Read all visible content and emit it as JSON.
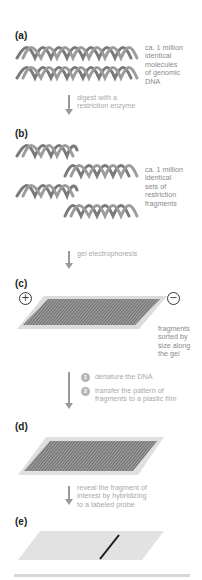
{
  "panels": {
    "a": {
      "label": "(a)",
      "description": [
        "ca. 1 million",
        "identical",
        "molecules",
        "of genomic",
        "DNA"
      ]
    },
    "b": {
      "label": "(b)",
      "description": [
        "ca. 1 million",
        "identical",
        "sets of",
        "restriction",
        "fragments"
      ]
    },
    "c": {
      "label": "(c)",
      "positive_pole": "+",
      "negative_pole": "−",
      "description": [
        "fragments",
        "sorted by",
        "size along",
        "the gel"
      ]
    },
    "d": {
      "label": "(d)"
    },
    "e": {
      "label": "(e)"
    }
  },
  "steps": {
    "a_to_b": [
      "digest with a",
      "restriction enzyme"
    ],
    "b_to_c": [
      "gel electrophoresis"
    ],
    "c_to_d": {
      "items": [
        {
          "number": "1",
          "text": [
            "denature the DNA"
          ]
        },
        {
          "number": "2",
          "text": [
            "transfer the pattern of",
            "fragments to a plastic film"
          ]
        }
      ]
    },
    "d_to_e": [
      "reveal the fragment of",
      "interest by hybridizing",
      "to a labeled probe"
    ]
  },
  "colors": {
    "dna": "#7a7a7a",
    "gel_surface": "#e2e2e2",
    "gel_bands": "#6e6e6e",
    "arrow": "#9a9a9a",
    "probe_band": "#1a1a1a"
  }
}
